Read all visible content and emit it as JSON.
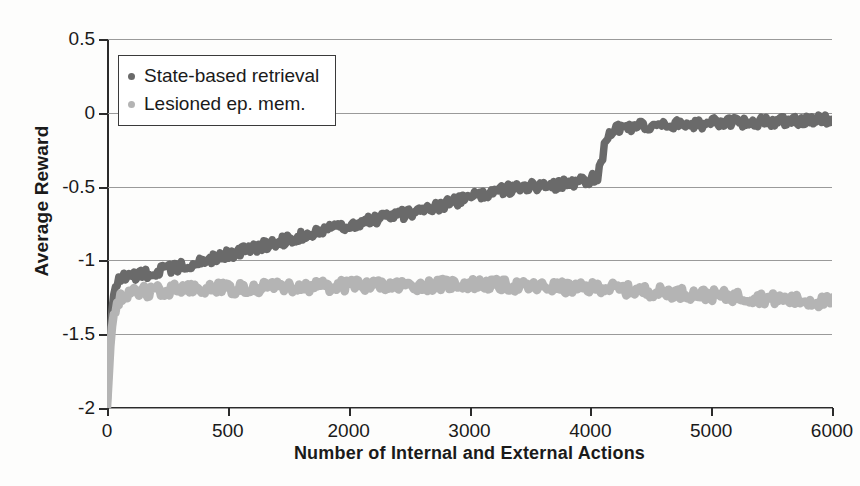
{
  "chart_data": {
    "type": "line",
    "title": "",
    "xlabel": "Number of Internal and External Actions",
    "ylabel": "Average Reward",
    "xlim": [
      0,
      6000
    ],
    "ylim": [
      -2,
      0.5
    ],
    "grid": true,
    "legend_position": "top-left",
    "xticks": [
      {
        "value": 0,
        "label": "0"
      },
      {
        "value": 1000,
        "label": "500"
      },
      {
        "value": 2000,
        "label": "2000"
      },
      {
        "value": 3000,
        "label": "3000"
      },
      {
        "value": 4000,
        "label": "4000"
      },
      {
        "value": 5000,
        "label": "5000"
      },
      {
        "value": 6000,
        "label": "6000"
      }
    ],
    "yticks": [
      {
        "value": 0.5,
        "label": "0.5"
      },
      {
        "value": 0,
        "label": "0"
      },
      {
        "value": -0.5,
        "label": "-0.5"
      },
      {
        "value": -1,
        "label": "-1"
      },
      {
        "value": -1.5,
        "label": "-1.5"
      },
      {
        "value": -2,
        "label": "-2"
      }
    ],
    "series": [
      {
        "name": "State-based retrieval",
        "color": "#6a6a6a",
        "noise": 0.035,
        "thickness": 7.5,
        "x": [
          0,
          15,
          30,
          50,
          80,
          120,
          200,
          350,
          500,
          700,
          900,
          1100,
          1300,
          1500,
          1700,
          1900,
          2100,
          2300,
          2500,
          2700,
          2900,
          3000,
          3100,
          3200,
          3300,
          3500,
          3700,
          3900,
          4000,
          4060,
          4090,
          4120,
          4160,
          4220,
          4300,
          4450,
          4600,
          4800,
          5000,
          5200,
          5400,
          5600,
          5800,
          6000
        ],
        "y": [
          -2.0,
          -1.72,
          -1.45,
          -1.25,
          -1.15,
          -1.12,
          -1.11,
          -1.09,
          -1.06,
          -1.02,
          -0.98,
          -0.94,
          -0.9,
          -0.86,
          -0.82,
          -0.78,
          -0.74,
          -0.71,
          -0.68,
          -0.64,
          -0.6,
          -0.58,
          -0.55,
          -0.53,
          -0.52,
          -0.5,
          -0.49,
          -0.47,
          -0.45,
          -0.44,
          -0.33,
          -0.22,
          -0.14,
          -0.11,
          -0.1,
          -0.09,
          -0.085,
          -0.08,
          -0.07,
          -0.065,
          -0.06,
          -0.055,
          -0.05,
          -0.05
        ]
      },
      {
        "name": "Lesioned ep. mem.",
        "color": "#b4b4b4",
        "noise": 0.04,
        "thickness": 8.5,
        "x": [
          0,
          15,
          30,
          50,
          80,
          120,
          200,
          350,
          500,
          700,
          900,
          1100,
          1400,
          1700,
          2000,
          2300,
          2600,
          2900,
          3100,
          3300,
          3500,
          3700,
          3900,
          4100,
          4300,
          4500,
          4700,
          4900,
          5100,
          5300,
          5500,
          5700,
          5900,
          6000
        ],
        "y": [
          -2.0,
          -1.78,
          -1.55,
          -1.38,
          -1.3,
          -1.24,
          -1.22,
          -1.21,
          -1.2,
          -1.19,
          -1.19,
          -1.19,
          -1.18,
          -1.18,
          -1.17,
          -1.17,
          -1.17,
          -1.16,
          -1.16,
          -1.17,
          -1.18,
          -1.18,
          -1.19,
          -1.18,
          -1.2,
          -1.21,
          -1.22,
          -1.23,
          -1.24,
          -1.25,
          -1.26,
          -1.27,
          -1.28,
          -1.28
        ]
      }
    ],
    "annotations": [
      {
        "text": "step transition",
        "x": 4100,
        "y": -0.25,
        "visible": false
      }
    ]
  },
  "legend": {
    "entries": [
      {
        "label": "State-based retrieval",
        "color": "#6a6a6a"
      },
      {
        "label": "Lesioned ep. mem.",
        "color": "#b4b4b4"
      }
    ]
  }
}
